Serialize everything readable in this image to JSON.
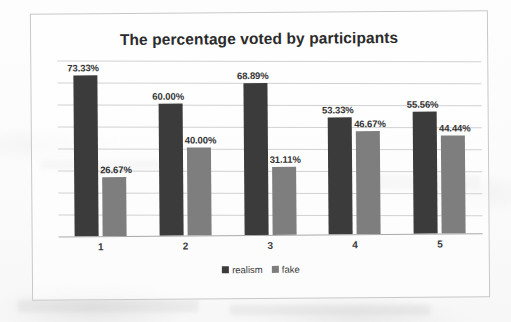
{
  "chart_data": {
    "type": "bar",
    "title": "The percentage voted by participants",
    "xlabel": "",
    "ylabel": "",
    "ylim": [
      0,
      80
    ],
    "grid": true,
    "legend_position": "bottom",
    "categories": [
      "1",
      "2",
      "3",
      "4",
      "5"
    ],
    "series": [
      {
        "name": "realism",
        "color": "#3b3b3b",
        "values": [
          73.33,
          60.0,
          68.89,
          53.33,
          55.56
        ],
        "labels": [
          "73.33%",
          "60.00%",
          "68.89%",
          "53.33%",
          "55.56%"
        ]
      },
      {
        "name": "fake",
        "color": "#7e7e7e",
        "values": [
          26.67,
          40.0,
          31.11,
          46.67,
          44.44
        ],
        "labels": [
          "26.67%",
          "40.00%",
          "31.11%",
          "46.67%",
          "44.44%"
        ]
      }
    ],
    "gridline_count": 8
  },
  "chart": {
    "title": "The percentage voted by participants",
    "legend": [
      {
        "label": "realism",
        "color": "#3b3b3b"
      },
      {
        "label": "fake",
        "color": "#7e7e7e"
      }
    ],
    "x_ticks": [
      "1",
      "2",
      "3",
      "4",
      "5"
    ],
    "bars": [
      {
        "group": "1",
        "series": "realism",
        "label": "73.33%",
        "value": 73.33
      },
      {
        "group": "1",
        "series": "fake",
        "label": "26.67%",
        "value": 26.67
      },
      {
        "group": "2",
        "series": "realism",
        "label": "60.00%",
        "value": 60.0
      },
      {
        "group": "2",
        "series": "fake",
        "label": "40.00%",
        "value": 40.0
      },
      {
        "group": "3",
        "series": "realism",
        "label": "68.89%",
        "value": 68.89
      },
      {
        "group": "3",
        "series": "fake",
        "label": "31.11%",
        "value": 31.11
      },
      {
        "group": "4",
        "series": "realism",
        "label": "53.33%",
        "value": 53.33
      },
      {
        "group": "4",
        "series": "fake",
        "label": "46.67%",
        "value": 46.67
      },
      {
        "group": "5",
        "series": "realism",
        "label": "55.56%",
        "value": 55.56
      },
      {
        "group": "5",
        "series": "fake",
        "label": "44.44%",
        "value": 44.44
      }
    ]
  }
}
